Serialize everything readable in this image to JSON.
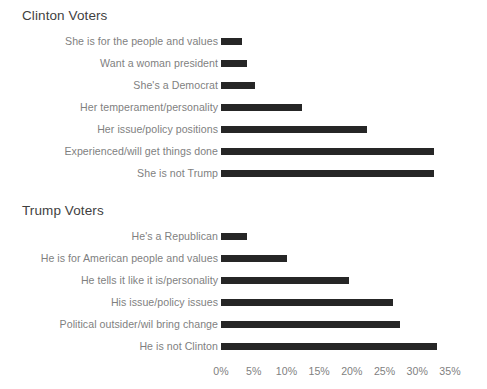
{
  "figure": {
    "background": "#ffffff",
    "bar_color": "#262626",
    "label_color": "#7f7f7f",
    "title_color": "#3f3f3f"
  },
  "chart_data": [
    {
      "type": "bar",
      "orientation": "horizontal",
      "title": "Clinton Voters",
      "xlabel": "",
      "ylabel": "",
      "xlim": [
        0,
        35
      ],
      "grid": false,
      "legend": "none",
      "tick_labels": [
        "0%",
        "5%",
        "10%",
        "15%",
        "20%",
        "25%",
        "30%",
        "35%"
      ],
      "tick_values": [
        0,
        5,
        10,
        15,
        20,
        25,
        30,
        35
      ],
      "categories": [
        "She is for the people and values",
        "Want a woman president",
        "She's a Democrat",
        "Her temperament/personality",
        "Her issue/policy positions",
        "Experienced/will get things done",
        "She is not Trump"
      ],
      "values": [
        3.2,
        4.0,
        5.2,
        12.4,
        22.3,
        32.5,
        32.5
      ]
    },
    {
      "type": "bar",
      "orientation": "horizontal",
      "title": "Trump Voters",
      "xlabel": "",
      "ylabel": "",
      "xlim": [
        0,
        35
      ],
      "grid": false,
      "legend": "none",
      "tick_labels": [
        "0%",
        "5%",
        "10%",
        "15%",
        "20%",
        "25%",
        "30%",
        "35%"
      ],
      "tick_values": [
        0,
        5,
        10,
        15,
        20,
        25,
        30,
        35
      ],
      "categories": [
        "He's a Republican",
        "He is for American people and values",
        "He tells it like it is/personality",
        "His issue/policy issues",
        "Political outsider/wil bring change",
        "He is not Clinton"
      ],
      "values": [
        4.0,
        10.1,
        19.5,
        26.3,
        27.3,
        33.0
      ]
    }
  ]
}
